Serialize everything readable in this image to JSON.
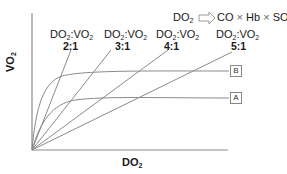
{
  "formula": {
    "lhs_main": "DO",
    "lhs_sub": "2",
    "rhs_parts": [
      "CO",
      "×",
      "Hb",
      "×",
      "SO"
    ],
    "rhs_sub": "2"
  },
  "axes": {
    "y_label_main": "VO",
    "y_label_sub": "2",
    "x_label_main": "DO",
    "x_label_sub": "2"
  },
  "ratio_lines": [
    {
      "top_main": "DO",
      "top_sub": "2",
      "mid": ":VO",
      "mid_sub": "2",
      "ratio": "2:1",
      "end": [
        71,
        50
      ]
    },
    {
      "top_main": "DO",
      "top_sub": "2",
      "mid": ":VO",
      "mid_sub": "2",
      "ratio": "3:1",
      "end": [
        111,
        50
      ]
    },
    {
      "top_main": "DO",
      "top_sub": "2",
      "mid": ":VO",
      "mid_sub": "2",
      "ratio": "4:1",
      "end": [
        168,
        50
      ]
    },
    {
      "top_main": "DO",
      "top_sub": "2",
      "mid": ":VO",
      "mid_sub": "2",
      "ratio": "5:1",
      "end": [
        232,
        52
      ]
    }
  ],
  "curves": [
    {
      "label": "B",
      "plateau_y": 71
    },
    {
      "label": "A",
      "plateau_y": 98
    }
  ],
  "colors": {
    "line": "#8a8a8a",
    "axis": "#8a8a8a",
    "text": "#1a1a1a",
    "arrow": "#9a9a9a"
  }
}
